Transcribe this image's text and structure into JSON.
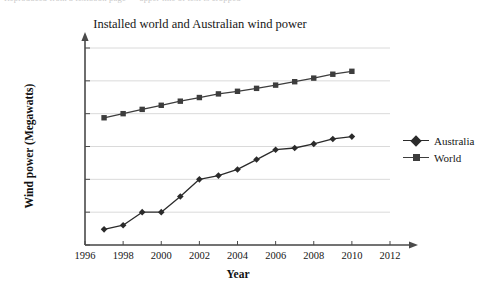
{
  "figure": {
    "top_cut_text": "Reproduced from a textbook page — upper line of text is cropped",
    "background": "#ffffff",
    "ink_color": "#1a1a1a",
    "grid_color": "#d6d6d6",
    "axis_color": "#4a4a4a"
  },
  "chart_data": {
    "type": "line",
    "title": "Installed world and Australian wind power",
    "xlabel": "Year",
    "ylabel": "Wind power (Megawatts)",
    "yscale": "log",
    "xlim": [
      1996,
      2012
    ],
    "ylim": [
      1,
      1000000
    ],
    "grid": "horizontal",
    "legend_position": "right",
    "xticks": [
      1996,
      1998,
      2000,
      2002,
      2004,
      2006,
      2008,
      2010,
      2012
    ],
    "xtick_labels": [
      "1996",
      "1998",
      "2000",
      "2002",
      "2004",
      "2006",
      "2008",
      "2010",
      "2012"
    ],
    "yticks": [
      1,
      10,
      100,
      1000,
      10000,
      100000,
      1000000
    ],
    "ytick_labels": [
      "1",
      "10",
      "100",
      "1000",
      "10 000",
      "100 000",
      "1 000 000"
    ],
    "x": [
      1997,
      1998,
      1999,
      2000,
      2001,
      2002,
      2003,
      2004,
      2005,
      2006,
      2007,
      2008,
      2009,
      2010
    ],
    "series": [
      {
        "name": "Australia",
        "marker": "diamond",
        "color": "#2b2b2b",
        "values": [
          3,
          4,
          10,
          10,
          30,
          100,
          130,
          200,
          400,
          800,
          900,
          1200,
          1700,
          2000
        ]
      },
      {
        "name": "World",
        "marker": "square",
        "color": "#3d3d3d",
        "values": [
          7500,
          10000,
          13500,
          18000,
          24000,
          31000,
          40000,
          48000,
          59000,
          74000,
          94000,
          121000,
          159000,
          195000
        ]
      }
    ]
  }
}
